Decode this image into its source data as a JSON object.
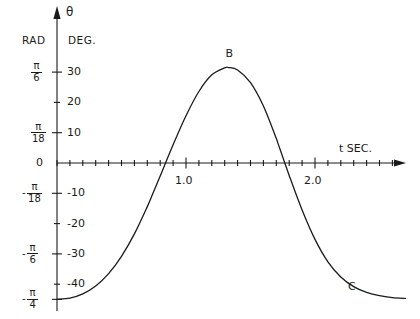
{
  "figure": {
    "background": "#ffffff",
    "ink": "#1a1a1a"
  },
  "axes": {
    "vertical": {
      "name": "theta-axis",
      "label": "θ",
      "headers": {
        "rad": "RAD",
        "deg": "DEG."
      }
    },
    "horizontal": {
      "name": "t-axis",
      "label": "t SEC."
    }
  },
  "deg_ticks": [
    {
      "value": 30,
      "label": "30",
      "major": true
    },
    {
      "value": 20,
      "label": "20",
      "major": false
    },
    {
      "value": 10,
      "label": "10",
      "major": true
    },
    {
      "value": 0,
      "label": "0",
      "major": true
    },
    {
      "value": -10,
      "label": "-10",
      "major": true
    },
    {
      "value": -20,
      "label": "-20",
      "major": false
    },
    {
      "value": -30,
      "label": "-30",
      "major": true
    },
    {
      "value": -40,
      "label": "-40",
      "major": false
    }
  ],
  "rad_ticks": [
    {
      "value": 30,
      "sign": "",
      "num": "π",
      "den": "6"
    },
    {
      "value": 10,
      "sign": "",
      "num": "π",
      "den": "18"
    },
    {
      "value": -10,
      "sign": "-",
      "num": "π",
      "den": "18"
    },
    {
      "value": -30,
      "sign": "-",
      "num": "π",
      "den": "6"
    },
    {
      "value": -45,
      "sign": "-",
      "num": "π",
      "den": "4"
    }
  ],
  "t_ticks": [
    {
      "value": 1.0,
      "label": "1.0"
    },
    {
      "value": 2.0,
      "label": "2.0"
    }
  ],
  "annotations": [
    {
      "name": "point-label-b",
      "text": "B",
      "t": 1.33,
      "deg": 36
    },
    {
      "name": "point-label-c",
      "text": "C",
      "t": 2.28,
      "deg": -41
    }
  ],
  "chart_data": {
    "type": "line",
    "title": "",
    "xlabel": "t SEC.",
    "ylabel": "θ",
    "xlim": [
      0,
      2.8
    ],
    "ylim": [
      -48,
      38
    ],
    "grid": false,
    "legend": null,
    "y_axis_secondary_units": "RAD",
    "x": [
      0.0,
      0.1,
      0.2,
      0.3,
      0.4,
      0.5,
      0.6,
      0.7,
      0.74,
      0.8,
      0.9,
      1.0,
      1.1,
      1.2,
      1.3,
      1.33,
      1.4,
      1.5,
      1.6,
      1.7,
      1.71,
      1.8,
      1.9,
      2.0,
      2.1,
      2.2,
      2.3,
      2.4,
      2.5,
      2.6,
      2.7
    ],
    "y": [
      -45.0,
      -44.6,
      -43.2,
      -40.6,
      -36.5,
      -30.8,
      -23.4,
      -14.4,
      -10.4,
      -4.3,
      6.0,
      15.6,
      23.6,
      29.1,
      31.4,
      31.5,
      30.7,
      26.5,
      18.8,
      8.1,
      6.9,
      -4.1,
      -15.5,
      -25.2,
      -32.6,
      -37.6,
      -40.8,
      -42.7,
      -43.8,
      -44.4,
      -44.7
    ],
    "annotations": [
      {
        "label": "B",
        "x": 1.33,
        "y": 31.5
      },
      {
        "label": "C",
        "x": 2.35,
        "y": -43.0
      }
    ]
  }
}
